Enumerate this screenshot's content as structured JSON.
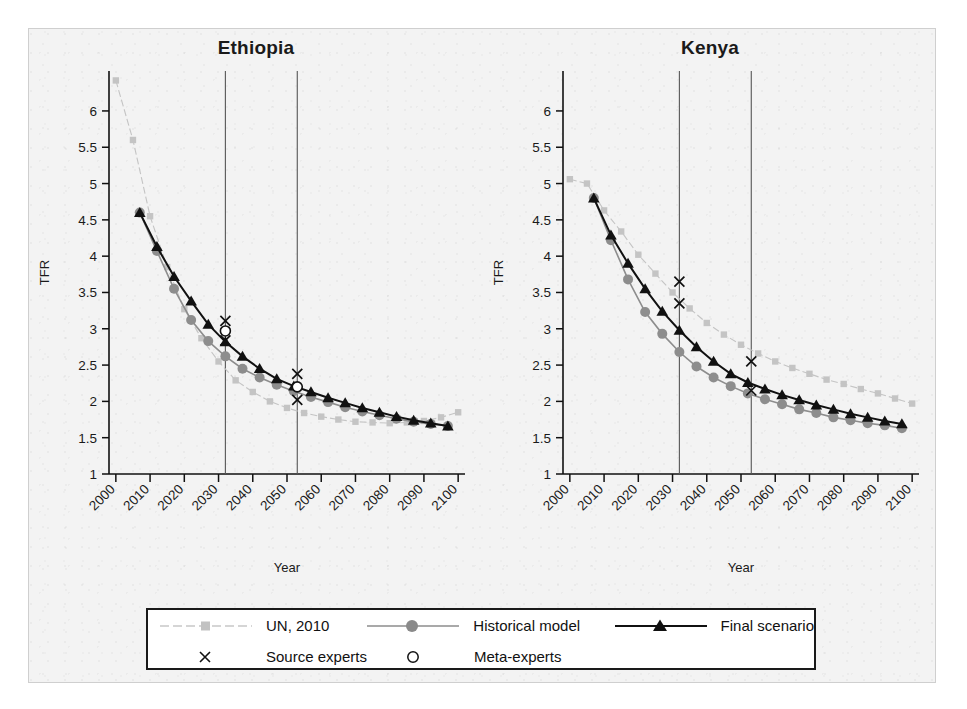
{
  "figure": {
    "background": "#f3f3f3",
    "axis_label_y": "TFR",
    "axis_label_x": "Year"
  },
  "legend": {
    "entries": [
      {
        "label": "UN, 2010",
        "marker": "square-marker",
        "line": "dashed-light-line",
        "color": "#c4c4c4"
      },
      {
        "label": "Historical model",
        "marker": "circle-marker",
        "line": "solid-gray-line",
        "color": "#8d8d8d"
      },
      {
        "label": "Final scenario",
        "marker": "triangle-marker",
        "line": "solid-black-line",
        "color": "#111111"
      },
      {
        "label": "Source experts",
        "marker": "cross-marker",
        "line": "none",
        "color": "#111111"
      },
      {
        "label": "Meta-experts",
        "marker": "open-circle-marker",
        "line": "none",
        "color": "#111111"
      }
    ]
  },
  "chart_data": [
    {
      "type": "line",
      "title": "Ethiopia",
      "xlabel": "Year",
      "ylabel": "TFR",
      "xlim": [
        1998,
        2102
      ],
      "ylim": [
        1,
        6.55
      ],
      "yticks": [
        1,
        1.5,
        2,
        2.5,
        3,
        3.5,
        4,
        4.5,
        5,
        5.5,
        6
      ],
      "xticks": [
        2000,
        2010,
        2020,
        2030,
        2040,
        2050,
        2060,
        2070,
        2080,
        2090,
        2100
      ],
      "grid": false,
      "vlines": [
        2032,
        2053
      ],
      "legend_position": "below-figure",
      "series": [
        {
          "name": "UN, 2010",
          "marker": "square",
          "color": "#c4c4c4",
          "x": [
            2000,
            2005,
            2010,
            2015,
            2020,
            2025,
            2030,
            2035,
            2040,
            2045,
            2050,
            2055,
            2060,
            2065,
            2070,
            2075,
            2080,
            2085,
            2090,
            2095,
            2100
          ],
          "y": [
            6.42,
            5.6,
            4.55,
            3.85,
            3.27,
            2.87,
            2.55,
            2.29,
            2.13,
            2.0,
            1.91,
            1.84,
            1.79,
            1.75,
            1.72,
            1.71,
            1.7,
            1.71,
            1.73,
            1.78,
            1.85
          ]
        },
        {
          "name": "Historical model",
          "marker": "circle",
          "color": "#8d8d8d",
          "x": [
            2007,
            2012,
            2017,
            2022,
            2027,
            2032,
            2037,
            2042,
            2047,
            2052,
            2057,
            2062,
            2067,
            2072,
            2077,
            2082,
            2087,
            2092,
            2097
          ],
          "y": [
            4.6,
            4.07,
            3.55,
            3.12,
            2.83,
            2.62,
            2.45,
            2.33,
            2.23,
            2.14,
            2.06,
            1.99,
            1.92,
            1.86,
            1.81,
            1.76,
            1.72,
            1.69,
            1.66
          ]
        },
        {
          "name": "Final scenario",
          "marker": "triangle",
          "color": "#111111",
          "x": [
            2007,
            2012,
            2017,
            2022,
            2027,
            2032,
            2037,
            2042,
            2047,
            2052,
            2057,
            2062,
            2067,
            2072,
            2077,
            2082,
            2087,
            2092,
            2097
          ],
          "y": [
            4.6,
            4.13,
            3.72,
            3.38,
            3.06,
            2.82,
            2.62,
            2.45,
            2.31,
            2.21,
            2.13,
            2.05,
            1.98,
            1.91,
            1.85,
            1.79,
            1.74,
            1.7,
            1.66
          ]
        },
        {
          "name": "Source experts",
          "marker": "cross",
          "color": "#111111",
          "points": [
            {
              "x": 2032,
              "y": 3.11
            },
            {
              "x": 2032,
              "y": 2.84
            },
            {
              "x": 2053,
              "y": 2.38
            },
            {
              "x": 2053,
              "y": 2.02
            }
          ]
        },
        {
          "name": "Meta-experts",
          "marker": "open-circle",
          "color": "#111111",
          "points": [
            {
              "x": 2032,
              "y": 2.97
            },
            {
              "x": 2053,
              "y": 2.2
            }
          ]
        }
      ]
    },
    {
      "type": "line",
      "title": "Kenya",
      "xlabel": "Year",
      "ylabel": "TFR",
      "xlim": [
        1998,
        2102
      ],
      "ylim": [
        1,
        6.55
      ],
      "yticks": [
        1,
        1.5,
        2,
        2.5,
        3,
        3.5,
        4,
        4.5,
        5,
        5.5,
        6
      ],
      "xticks": [
        2000,
        2010,
        2020,
        2030,
        2040,
        2050,
        2060,
        2070,
        2080,
        2090,
        2100
      ],
      "grid": false,
      "vlines": [
        2032,
        2053
      ],
      "legend_position": "below-figure",
      "series": [
        {
          "name": "UN, 2010",
          "marker": "square",
          "color": "#c4c4c4",
          "x": [
            2000,
            2005,
            2010,
            2015,
            2020,
            2025,
            2030,
            2035,
            2040,
            2045,
            2050,
            2055,
            2060,
            2065,
            2070,
            2075,
            2080,
            2085,
            2090,
            2095,
            2100
          ],
          "y": [
            5.06,
            5.0,
            4.63,
            4.34,
            4.02,
            3.76,
            3.5,
            3.28,
            3.08,
            2.92,
            2.78,
            2.66,
            2.55,
            2.46,
            2.38,
            2.3,
            2.24,
            2.17,
            2.11,
            2.04,
            1.97
          ]
        },
        {
          "name": "Historical model",
          "marker": "circle",
          "color": "#8d8d8d",
          "x": [
            2007,
            2012,
            2017,
            2022,
            2027,
            2032,
            2037,
            2042,
            2047,
            2052,
            2057,
            2062,
            2067,
            2072,
            2077,
            2082,
            2087,
            2092,
            2097
          ],
          "y": [
            4.8,
            4.22,
            3.68,
            3.23,
            2.93,
            2.68,
            2.48,
            2.33,
            2.21,
            2.11,
            2.03,
            1.96,
            1.89,
            1.84,
            1.78,
            1.74,
            1.7,
            1.67,
            1.63
          ]
        },
        {
          "name": "Final scenario",
          "marker": "triangle",
          "color": "#111111",
          "x": [
            2007,
            2012,
            2017,
            2022,
            2027,
            2032,
            2037,
            2042,
            2047,
            2052,
            2057,
            2062,
            2067,
            2072,
            2077,
            2082,
            2087,
            2092,
            2097
          ],
          "y": [
            4.8,
            4.29,
            3.9,
            3.55,
            3.24,
            2.98,
            2.75,
            2.55,
            2.38,
            2.26,
            2.17,
            2.09,
            2.02,
            1.95,
            1.89,
            1.83,
            1.78,
            1.73,
            1.69
          ]
        },
        {
          "name": "Source experts",
          "marker": "cross",
          "color": "#111111",
          "points": [
            {
              "x": 2032,
              "y": 3.65
            },
            {
              "x": 2032,
              "y": 3.35
            },
            {
              "x": 2053,
              "y": 2.55
            },
            {
              "x": 2053,
              "y": 2.15
            }
          ]
        },
        {
          "name": "Meta-experts",
          "marker": "open-circle",
          "color": "#111111",
          "points": []
        }
      ]
    }
  ]
}
